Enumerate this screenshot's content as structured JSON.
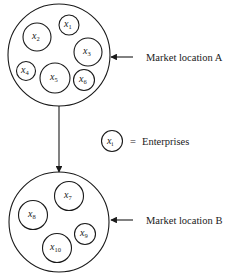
{
  "diagram": {
    "markets": [
      {
        "id": "A",
        "label": "Market location A",
        "circle": {
          "cx": 59,
          "cy": 55,
          "r": 51
        },
        "enterprises": [
          {
            "var": "x",
            "sub": "1",
            "cx": 69,
            "cy": 25,
            "r": 10
          },
          {
            "var": "x",
            "sub": "2",
            "cx": 37,
            "cy": 37,
            "r": 14
          },
          {
            "var": "x",
            "sub": "3",
            "cx": 88,
            "cy": 52,
            "r": 14
          },
          {
            "var": "x",
            "sub": "4",
            "cx": 26,
            "cy": 71,
            "r": 9.5
          },
          {
            "var": "x",
            "sub": "5",
            "cx": 55,
            "cy": 78,
            "r": 15
          },
          {
            "var": "x",
            "sub": "6",
            "cx": 84,
            "cy": 80,
            "r": 10.5
          }
        ],
        "arrow": {
          "x1": 133,
          "y1": 57,
          "x2": 111,
          "y2": 57
        }
      },
      {
        "id": "B",
        "label": "Market location B",
        "circle": {
          "cx": 59,
          "cy": 222,
          "r": 50
        },
        "enterprises": [
          {
            "var": "x",
            "sub": "7",
            "cx": 69,
            "cy": 196,
            "r": 14.5
          },
          {
            "var": "x",
            "sub": "8",
            "cx": 33,
            "cy": 215,
            "r": 14.5
          },
          {
            "var": "x",
            "sub": "9",
            "cx": 85,
            "cy": 234,
            "r": 10.5
          },
          {
            "var": "x",
            "sub": "10",
            "cx": 57,
            "cy": 248,
            "r": 14.5
          }
        ],
        "arrow": {
          "x1": 133,
          "y1": 220,
          "x2": 111,
          "y2": 220
        }
      }
    ],
    "flow_arrow": {
      "x1": 59,
      "y1": 106,
      "x2": 59,
      "y2": 172
    },
    "legend": {
      "symbol_var": "x",
      "symbol_sub": "i",
      "symbol_circle": {
        "cx": 112,
        "cy": 141,
        "r": 10.5
      },
      "equals": "=",
      "text": "Enterprises"
    }
  }
}
